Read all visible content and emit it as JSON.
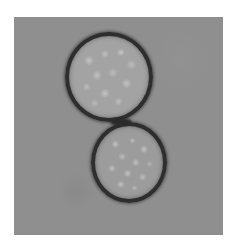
{
  "image": {
    "subject": "Two spherical cells in contact, brightfield micrograph",
    "frame_color": "#8f8f8f",
    "page_background": "#ffffff",
    "cells": [
      {
        "id": "cell-1",
        "position": "upper",
        "rim_color": "#2e2e2e",
        "interior_color": "#a3a3a3"
      },
      {
        "id": "cell-2",
        "position": "lower",
        "rim_color": "#2e2e2e",
        "interior_color": "#9c9c9c"
      }
    ]
  }
}
